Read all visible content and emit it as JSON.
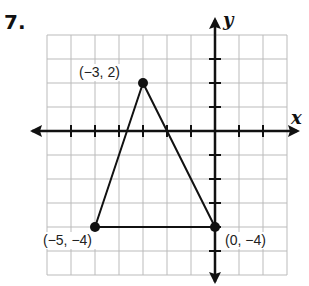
{
  "problem": {
    "number": "7."
  },
  "chart_data": {
    "type": "scatter",
    "title": "",
    "xlabel": "x",
    "ylabel": "y",
    "xlim": [
      -7,
      3
    ],
    "ylim": [
      -6,
      4
    ],
    "grid": true,
    "points": [
      {
        "x": -3,
        "y": 2,
        "label": "(−3, 2)"
      },
      {
        "x": -5,
        "y": -4,
        "label": "(−5, −4)"
      },
      {
        "x": 0,
        "y": -4,
        "label": "(0, −4)"
      }
    ],
    "polygon": "triangle connecting (−3, 2), (−5, −4), (0, −4)"
  }
}
